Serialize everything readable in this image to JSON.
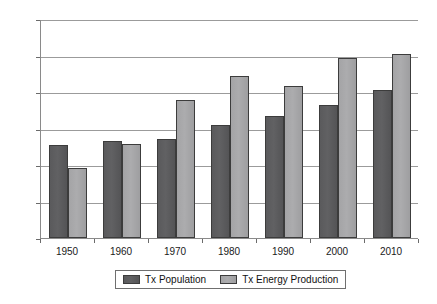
{
  "chart_data": {
    "type": "bar",
    "title": "",
    "subtitle": "",
    "xlabel": "",
    "ylabel": "",
    "categories": [
      "1950",
      "1960",
      "1970",
      "1980",
      "1990",
      "2000",
      "2010"
    ],
    "series": [
      {
        "name": "Tx Population",
        "color": "#5a5a5c",
        "values": [
          5.1,
          5.3,
          5.4,
          6.2,
          6.7,
          7.3,
          8.1
        ]
      },
      {
        "name": "Tx Energy Production",
        "color": "#a6a6a8",
        "values": [
          3.85,
          5.15,
          7.55,
          8.9,
          8.35,
          9.85,
          10.1
        ]
      }
    ],
    "ylim": [
      0,
      12
    ],
    "yticks": [
      0,
      2,
      4,
      6,
      8,
      10,
      12
    ],
    "ytick_labels": [
      "0%",
      "2%",
      "4%",
      "6%",
      "8%",
      "10%",
      "12%"
    ],
    "grid": true,
    "grid_axis": "y",
    "legend_position": "bottom",
    "value_unit": "%"
  },
  "legend": {
    "entries": [
      {
        "label": "Tx Population"
      },
      {
        "label": "Tx Energy Production"
      }
    ]
  }
}
